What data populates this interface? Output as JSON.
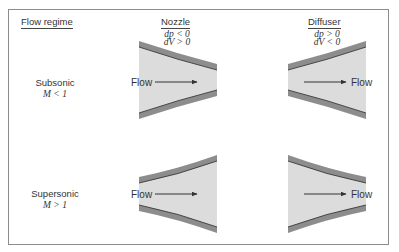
{
  "headers": {
    "regime": "Flow regime",
    "nozzle": {
      "title": "Nozzle",
      "eq1": "dp < 0",
      "eq2": "dV > 0"
    },
    "diffuser": {
      "title": "Diffuser",
      "eq1": "dp > 0",
      "eq2": "dV < 0"
    }
  },
  "rows": [
    {
      "name": "Subsonic",
      "condition": "M < 1",
      "nozzle_shape": "converging",
      "diffuser_shape": "diverging"
    },
    {
      "name": "Supersonic",
      "condition": "M > 1",
      "nozzle_shape": "diverging",
      "diffuser_shape": "converging"
    }
  ],
  "flow_label": "Flow",
  "colors": {
    "wall": "#8d8d8d",
    "wall_edge": "#3a3a3a",
    "interior": "#dcdcdc",
    "arrow": "#333333",
    "border": "#8c8c8c"
  }
}
